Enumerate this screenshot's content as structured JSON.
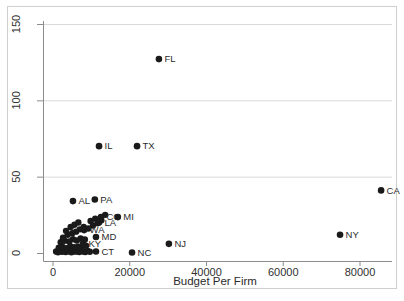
{
  "chart_data": {
    "type": "scatter",
    "title": "",
    "xlabel": "Budget Per Firm",
    "ylabel": "",
    "xlim": [
      0,
      80000
    ],
    "ylim": [
      0,
      150
    ],
    "x_ticks": [
      {
        "value": 0,
        "label": "0"
      },
      {
        "value": 20000,
        "label": "20000"
      },
      {
        "value": 40000,
        "label": "40000"
      },
      {
        "value": 60000,
        "label": "60000"
      },
      {
        "value": 80000,
        "label": "80000"
      }
    ],
    "y_ticks": [
      {
        "value": 0,
        "label": "0"
      },
      {
        "value": 50,
        "label": "50"
      },
      {
        "value": 100,
        "label": "100"
      },
      {
        "value": 150,
        "label": "150"
      }
    ],
    "gridline_y_values": [
      50,
      100,
      150
    ],
    "legend": "none",
    "labeled_points": [
      {
        "label": "FL",
        "x": 27600,
        "y": 127
      },
      {
        "label": "IL",
        "x": 12000,
        "y": 70
      },
      {
        "label": "TX",
        "x": 21900,
        "y": 70
      },
      {
        "label": "CA",
        "x": 85500,
        "y": 41
      },
      {
        "label": "NY",
        "x": 74800,
        "y": 12
      },
      {
        "label": "NJ",
        "x": 30200,
        "y": 6
      },
      {
        "label": "NC",
        "x": 20600,
        "y": 0.3
      },
      {
        "label": "CT",
        "x": 11200,
        "y": 1
      },
      {
        "label": "AL",
        "x": 5200,
        "y": 34
      },
      {
        "label": "PA",
        "x": 10900,
        "y": 35
      },
      {
        "label": "CO",
        "x": 12500,
        "y": 23.5
      },
      {
        "label": "MI",
        "x": 16900,
        "y": 23.5
      },
      {
        "label": "LA",
        "x": 12000,
        "y": 20
      },
      {
        "label": "WA",
        "x": 8100,
        "y": 15
      },
      {
        "label": "MD",
        "x": 11200,
        "y": 10.5
      },
      {
        "label": "KY",
        "x": 7800,
        "y": 6
      }
    ],
    "unlabeled_cluster_points": [
      [
        800,
        1
      ],
      [
        1300,
        0.5
      ],
      [
        1800,
        1.5
      ],
      [
        2300,
        0.8
      ],
      [
        2800,
        1.2
      ],
      [
        3300,
        0.6
      ],
      [
        3800,
        1.8
      ],
      [
        4300,
        1
      ],
      [
        4800,
        0.5
      ],
      [
        5300,
        1.5
      ],
      [
        5800,
        0.9
      ],
      [
        6300,
        1.3
      ],
      [
        6800,
        0.6
      ],
      [
        7300,
        1.6
      ],
      [
        7800,
        1
      ],
      [
        8400,
        0.7
      ],
      [
        9000,
        1.4
      ],
      [
        9600,
        0.8
      ],
      [
        1500,
        3.5
      ],
      [
        2500,
        4
      ],
      [
        3500,
        3.2
      ],
      [
        4500,
        4.5
      ],
      [
        5500,
        3.8
      ],
      [
        6500,
        4.2
      ],
      [
        7500,
        3.4
      ],
      [
        8600,
        4.8
      ],
      [
        2000,
        7
      ],
      [
        3000,
        8
      ],
      [
        4200,
        7.5
      ],
      [
        5200,
        9
      ],
      [
        6200,
        8.2
      ],
      [
        7200,
        9.5
      ],
      [
        8300,
        8.8
      ],
      [
        2600,
        10
      ],
      [
        3800,
        12
      ],
      [
        5000,
        13
      ],
      [
        3400,
        14.5
      ],
      [
        6000,
        14
      ],
      [
        7000,
        15.5
      ],
      [
        4600,
        17
      ],
      [
        8000,
        17
      ],
      [
        5600,
        18.5
      ],
      [
        9200,
        16
      ],
      [
        10400,
        18
      ],
      [
        6600,
        20
      ],
      [
        11600,
        19.5
      ],
      [
        9800,
        21
      ],
      [
        11000,
        22.5
      ],
      [
        12600,
        21.5
      ],
      [
        13600,
        25
      ]
    ],
    "colors": {
      "point": "#1a1a1a",
      "point_label": "#2b2b2b",
      "axis": "#8c8c8c",
      "gridline": "#d9d9d9",
      "tick_label": "#303030",
      "frame": "#cfcfcf",
      "background": "#ffffff"
    }
  }
}
